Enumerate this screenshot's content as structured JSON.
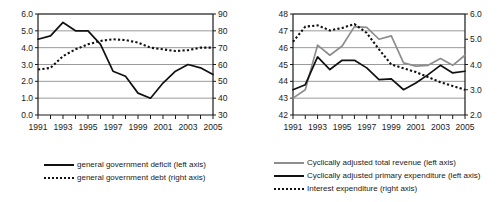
{
  "figure": {
    "background": "#ffffff",
    "panels": [
      "left",
      "right"
    ]
  },
  "colors": {
    "axis": "#1a1a1a",
    "gridline": "#9a9a9a",
    "series_black": "#111111",
    "series_gray": "#8d8d8d",
    "text": "#1a1a1a"
  },
  "chart_data": [
    {
      "id": "general-government",
      "type": "line",
      "title": "",
      "subtitle": "",
      "xlabel": "",
      "ylabel": "",
      "grid": true,
      "legend_position": "bottom-left",
      "x": [
        1991,
        1992,
        1993,
        1994,
        1995,
        1996,
        1997,
        1998,
        1999,
        2000,
        2001,
        2002,
        2003,
        2004,
        2005
      ],
      "xtick_labels": [
        "1991",
        "1993",
        "1995",
        "1997",
        "1999",
        "2001",
        "2003",
        "2005"
      ],
      "xtick_values": [
        1991,
        1993,
        1995,
        1997,
        1999,
        2001,
        2003,
        2005
      ],
      "xlim": [
        1991,
        2005
      ],
      "left_axis": {
        "ylim": [
          0.0,
          6.0
        ],
        "ytick_labels": [
          "0.0",
          "1.0",
          "2.0",
          "3.0",
          "4.0",
          "5.0",
          "6.0"
        ],
        "ytick_values": [
          0.0,
          1.0,
          2.0,
          3.0,
          4.0,
          5.0,
          6.0
        ]
      },
      "right_axis": {
        "ylim": [
          30,
          90
        ],
        "ytick_labels": [
          "30",
          "40",
          "50",
          "60",
          "70",
          "80",
          "90"
        ],
        "ytick_values": [
          30,
          40,
          50,
          60,
          70,
          80,
          90
        ]
      },
      "series": [
        {
          "name": "general government deficit (left axis)",
          "axis": "left",
          "style": "solid",
          "color": "#111111",
          "values": [
            4.5,
            4.7,
            5.5,
            5.0,
            5.0,
            4.2,
            2.6,
            2.3,
            1.3,
            1.0,
            1.9,
            2.6,
            3.0,
            2.8,
            2.4
          ]
        },
        {
          "name": "general government debt (right axis)",
          "axis": "right",
          "style": "dotted",
          "color": "#111111",
          "values": [
            57,
            58,
            65,
            69,
            72,
            74,
            75,
            74.5,
            73,
            70,
            69,
            68,
            68.5,
            70,
            70
          ]
        }
      ]
    },
    {
      "id": "cyclically-adjusted",
      "type": "line",
      "title": "",
      "subtitle": "",
      "xlabel": "",
      "ylabel": "",
      "grid": true,
      "legend_position": "bottom-left",
      "x": [
        1991,
        1992,
        1993,
        1994,
        1995,
        1996,
        1997,
        1998,
        1999,
        2000,
        2001,
        2002,
        2003,
        2004,
        2005
      ],
      "xtick_labels": [
        "1991",
        "1993",
        "1995",
        "1997",
        "1999",
        "2001",
        "2003",
        "2005"
      ],
      "xtick_values": [
        1991,
        1993,
        1995,
        1997,
        1999,
        2001,
        2003,
        2005
      ],
      "xlim": [
        1991,
        2005
      ],
      "left_axis": {
        "ylim": [
          42,
          48
        ],
        "ytick_labels": [
          "42",
          "43",
          "44",
          "45",
          "46",
          "47",
          "48"
        ],
        "ytick_values": [
          42,
          43,
          44,
          45,
          46,
          47,
          48
        ]
      },
      "right_axis": {
        "ylim": [
          2.0,
          6.0
        ],
        "ytick_labels": [
          "2.0",
          "3.0",
          "4.0",
          "5.0",
          "6.0"
        ],
        "ytick_values": [
          2.0,
          3.0,
          4.0,
          5.0,
          6.0
        ]
      },
      "series": [
        {
          "name": "Cyclically adjusted total revenue (left axis)",
          "axis": "left",
          "style": "solid",
          "color": "#8d8d8d",
          "values": [
            43.0,
            43.5,
            46.15,
            45.55,
            46.1,
            47.25,
            47.2,
            46.5,
            46.7,
            45.1,
            44.9,
            44.95,
            45.35,
            44.95,
            45.55
          ]
        },
        {
          "name": "Cyclically adjusted primary expenditure (left axis)",
          "axis": "left",
          "style": "solid",
          "color": "#111111",
          "values": [
            43.5,
            43.8,
            45.45,
            44.7,
            45.25,
            45.25,
            44.8,
            44.1,
            44.15,
            43.5,
            43.9,
            44.4,
            44.95,
            44.5,
            44.6
          ]
        },
        {
          "name": "Interest expenditure (right axis)",
          "axis": "right",
          "style": "dotted",
          "color": "#111111",
          "values": [
            4.9,
            5.5,
            5.55,
            5.35,
            5.45,
            5.6,
            5.25,
            4.6,
            4.0,
            3.85,
            3.7,
            3.5,
            3.3,
            3.15,
            3.0
          ]
        }
      ]
    }
  ],
  "legends": {
    "left": [
      {
        "label": "general government deficit (left axis)",
        "style": "solid-black"
      },
      {
        "label": "general government debt (right axis)",
        "style": "dotted-black"
      }
    ],
    "right": [
      {
        "label": "Cyclically adjusted total revenue (left axis)",
        "style": "solid-gray"
      },
      {
        "label": "Cyclically adjusted primary expenditure (left axis)",
        "style": "solid-black"
      },
      {
        "label": "Interest expenditure (right axis)",
        "style": "dotted-black"
      }
    ]
  }
}
